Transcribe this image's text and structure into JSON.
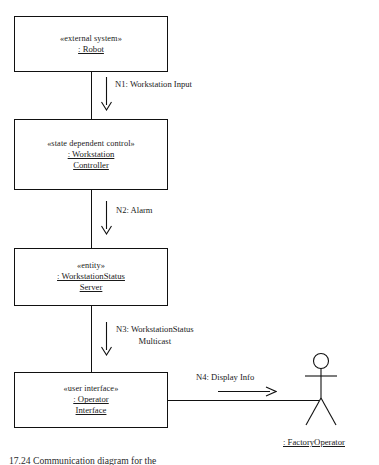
{
  "diagram": {
    "title_caption": "17.24 Communication diagram for the",
    "objects": [
      {
        "id": "robot",
        "stereotype": "«external system»",
        "name_line1": ": Robot",
        "name_line2": ""
      },
      {
        "id": "workstation-controller",
        "stereotype": "«state dependent control»",
        "name_line1": ": Workstation",
        "name_line2": "Controller"
      },
      {
        "id": "workstation-status-server",
        "stereotype": "«entity»",
        "name_line1": ": WorkstationStatus",
        "name_line2": "Server"
      },
      {
        "id": "operator-interface",
        "stereotype": "«user interface»",
        "name_line1": ": Operator",
        "name_line2": "Interface"
      }
    ],
    "messages": [
      {
        "id": "n1",
        "line1": "N1: Workstation Input",
        "line2": ""
      },
      {
        "id": "n2",
        "line1": "N2: Alarm",
        "line2": ""
      },
      {
        "id": "n3",
        "line1": "N3: WorkstationStatus",
        "line2": "Multicast"
      },
      {
        "id": "n4",
        "line1": "N4: Display Info",
        "line2": ""
      }
    ],
    "actor": {
      "id": "factory-operator",
      "label": ": FactoryOperator"
    },
    "colors": {
      "stroke": "#111111",
      "background": "#ffffff",
      "text": "#1a1a1a"
    }
  }
}
